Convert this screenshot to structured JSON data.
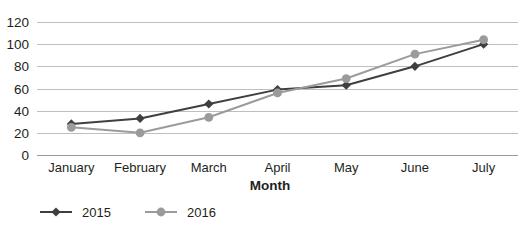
{
  "chart_data": {
    "type": "line",
    "title": "",
    "subtitle": "",
    "xlabel": "Month",
    "ylabel": "",
    "categories": [
      "January",
      "February",
      "March",
      "April",
      "May",
      "June",
      "July"
    ],
    "series": [
      {
        "name": "2015",
        "color": "#3f3f3f",
        "marker": "diamond",
        "values": [
          28,
          33,
          46,
          59,
          63,
          80,
          100
        ]
      },
      {
        "name": "2016",
        "color": "#9b9b9b",
        "marker": "circle",
        "values": [
          25,
          20,
          34,
          56,
          69,
          91,
          104
        ]
      }
    ],
    "ylim": [
      0,
      120
    ],
    "ytick_step": 20,
    "yticks": [
      "0",
      "20",
      "40",
      "60",
      "80",
      "100",
      "120"
    ],
    "grid": true,
    "grid_axis": "y",
    "grid_color": "#bfbfbf",
    "legend": {
      "position": "bottom-left",
      "entries": [
        {
          "label": "2015",
          "color": "#3f3f3f"
        },
        {
          "label": "2016",
          "color": "#9b9b9b"
        }
      ]
    },
    "background": "#ffffff"
  }
}
